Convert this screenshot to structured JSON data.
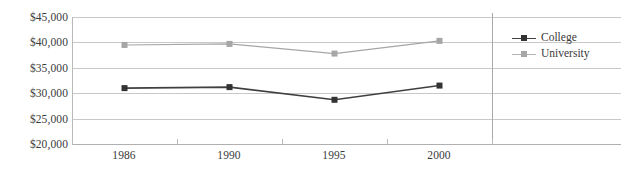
{
  "chart_data": {
    "type": "line",
    "title": "",
    "subtitle": "",
    "xlabel": "",
    "ylabel": "",
    "categories": [
      "1986",
      "1990",
      "1995",
      "2000"
    ],
    "series": [
      {
        "name": "College",
        "color": "#404040",
        "marker": "square",
        "values": [
          31000,
          31200,
          28700,
          31500
        ]
      },
      {
        "name": "University",
        "color": "#a6a6a6",
        "marker": "square",
        "values": [
          39500,
          39700,
          37800,
          40300
        ]
      }
    ],
    "ylim": [
      20000,
      45000
    ],
    "ytick_values": [
      20000,
      25000,
      30000,
      35000,
      40000,
      45000
    ],
    "ytick_labels": [
      "$20,000",
      "$25,000",
      "$30,000",
      "$35,000",
      "$40,000",
      "$45,000"
    ],
    "grid": true,
    "grid_axis": "y",
    "legend_position": "right"
  },
  "axes": {
    "y_labels": [
      "$45,000",
      "$40,000",
      "$35,000",
      "$30,000",
      "$25,000",
      "$20,000"
    ],
    "x_labels": [
      "1986",
      "1990",
      "1995",
      "2000"
    ]
  },
  "legend": {
    "items": [
      {
        "label": "College",
        "color": "#404040"
      },
      {
        "label": "University",
        "color": "#a6a6a6"
      }
    ]
  },
  "colors": {
    "college": "#404040",
    "university": "#a6a6a6",
    "grid": "#c8c8c8",
    "axis": "#b0b0b0",
    "text": "#3a3a3a",
    "background": "#ffffff"
  }
}
